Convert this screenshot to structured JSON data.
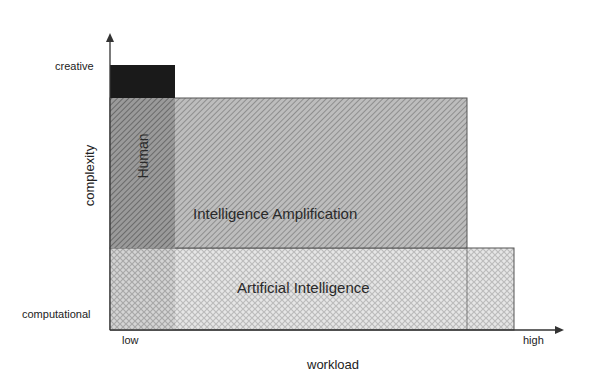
{
  "diagram": {
    "title": "",
    "axes": {
      "x": {
        "label": "workload",
        "min_label": "low",
        "max_label": "high"
      },
      "y": {
        "label": "complexity",
        "min_label": "computational",
        "max_label": "creative"
      }
    },
    "regions": [
      {
        "id": "creative-block",
        "label": "",
        "fill": "#1a1a1a",
        "pattern": "solid"
      },
      {
        "id": "human",
        "label": "Human",
        "fill": "#8c8c8c",
        "pattern": "dense-diagonal-hatch"
      },
      {
        "id": "intelligence-amplification",
        "label": "Intelligence Amplification",
        "fill": "#a8a8a8",
        "pattern": "diagonal-hatch"
      },
      {
        "id": "artificial-intelligence",
        "label": "Artificial Intelligence",
        "fill": "#d6d6d6",
        "pattern": "crosshatch"
      }
    ],
    "colors": {
      "axis": "#333333",
      "border": "#555555",
      "creative_block": "#1a1a1a",
      "human_hatch": "#7a7a7a",
      "ia_hatch": "#9a9a9a",
      "ai_crosshatch": "#c4c4c4"
    }
  }
}
